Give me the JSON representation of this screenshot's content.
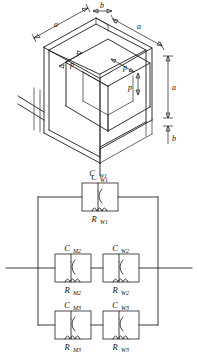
{
  "figure": {
    "top_diagram": {
      "name": "cube-geometry-diagram",
      "dimension_labels": [
        {
          "id": "a-top-left",
          "text": "a"
        },
        {
          "id": "b-top",
          "text": "b"
        },
        {
          "id": "a-top-right",
          "text": "a"
        },
        {
          "id": "a-right",
          "text": "a"
        },
        {
          "id": "b-right",
          "text": "b"
        },
        {
          "id": "p-left",
          "text": "p"
        },
        {
          "id": "p-middle",
          "text": "p"
        },
        {
          "id": "p-lower",
          "text": "p"
        }
      ],
      "terminal_label": "C",
      "terminal_label_sub": "W1"
    },
    "circuit": {
      "name": "equivalent-circuit-diagram",
      "branches": [
        {
          "id": "branch-1",
          "blocks": [
            {
              "cap": "C",
              "cap_sub": "W1",
              "res": "R",
              "res_sub": "W1"
            }
          ]
        },
        {
          "id": "branch-2",
          "blocks": [
            {
              "cap": "C",
              "cap_sub": "M2",
              "res": "R",
              "res_sub": "M2"
            },
            {
              "cap": "C",
              "cap_sub": "W2",
              "res": "R",
              "res_sub": "W2"
            }
          ]
        },
        {
          "id": "branch-3",
          "blocks": [
            {
              "cap": "C",
              "cap_sub": "M3",
              "res": "R",
              "res_sub": "M3"
            },
            {
              "cap": "C",
              "cap_sub": "W3",
              "res": "R",
              "res_sub": "W3"
            }
          ]
        }
      ]
    },
    "colors": {
      "line": "#1a1a1a",
      "wire": "#3a3a3a",
      "background": "#ffffff"
    }
  }
}
